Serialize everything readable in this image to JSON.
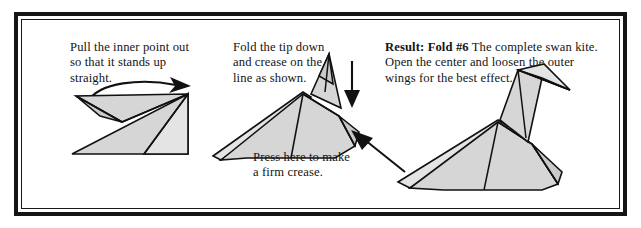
{
  "document": {
    "kind": "origami-instruction-figure",
    "subject": "swan kite"
  },
  "frame": {
    "outer_color": "#151515",
    "inner_color": "#1a1a1a",
    "background": "#ffffff"
  },
  "style": {
    "paper_fill": "#d6d6d6",
    "paper_fill_dark": "#c9c9c9",
    "paper_fill_light": "#e4e4e4",
    "line_color": "#111111",
    "text_color": "#141414"
  },
  "panels": [
    {
      "id": "panel-1",
      "caption": "Pull the inner point out\nso that it stands up\nstraight.",
      "figure_name": "kite-with-inner-point",
      "arrow": {
        "name": "curved-pull-arrow",
        "direction": "right",
        "style": "curved"
      }
    },
    {
      "id": "panel-2",
      "caption": "Fold the tip down\nand crease on the\nline as shown.",
      "figure_name": "swan-kite-with-raised-neck",
      "sub_caption": "Press here to make\na firm crease.",
      "arrows": [
        {
          "name": "fold-down-arrow",
          "direction": "down",
          "style": "straight"
        },
        {
          "name": "press-here-arrow",
          "direction": "up-left",
          "style": "straight"
        }
      ]
    },
    {
      "id": "panel-3",
      "caption_bold": "Result: Fold #6",
      "caption_rest": "  The complete swan kite. Open the center and loosen the outer wings for the best effect.",
      "figure_name": "completed-swan-kite"
    }
  ]
}
